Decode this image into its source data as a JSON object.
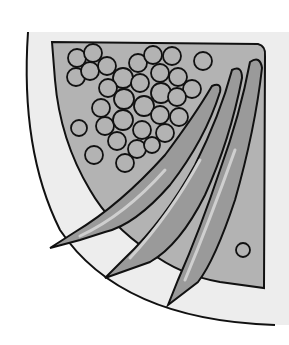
{
  "illustration": {
    "subject": "plate with peas and asparagus",
    "colors": {
      "background": "#ffffff",
      "plate": "#ededed",
      "food_bg": "#b3b3b3",
      "asparagus": "#9a9a9a",
      "highlight": "#cfcfcf",
      "outline": "#111111"
    }
  }
}
